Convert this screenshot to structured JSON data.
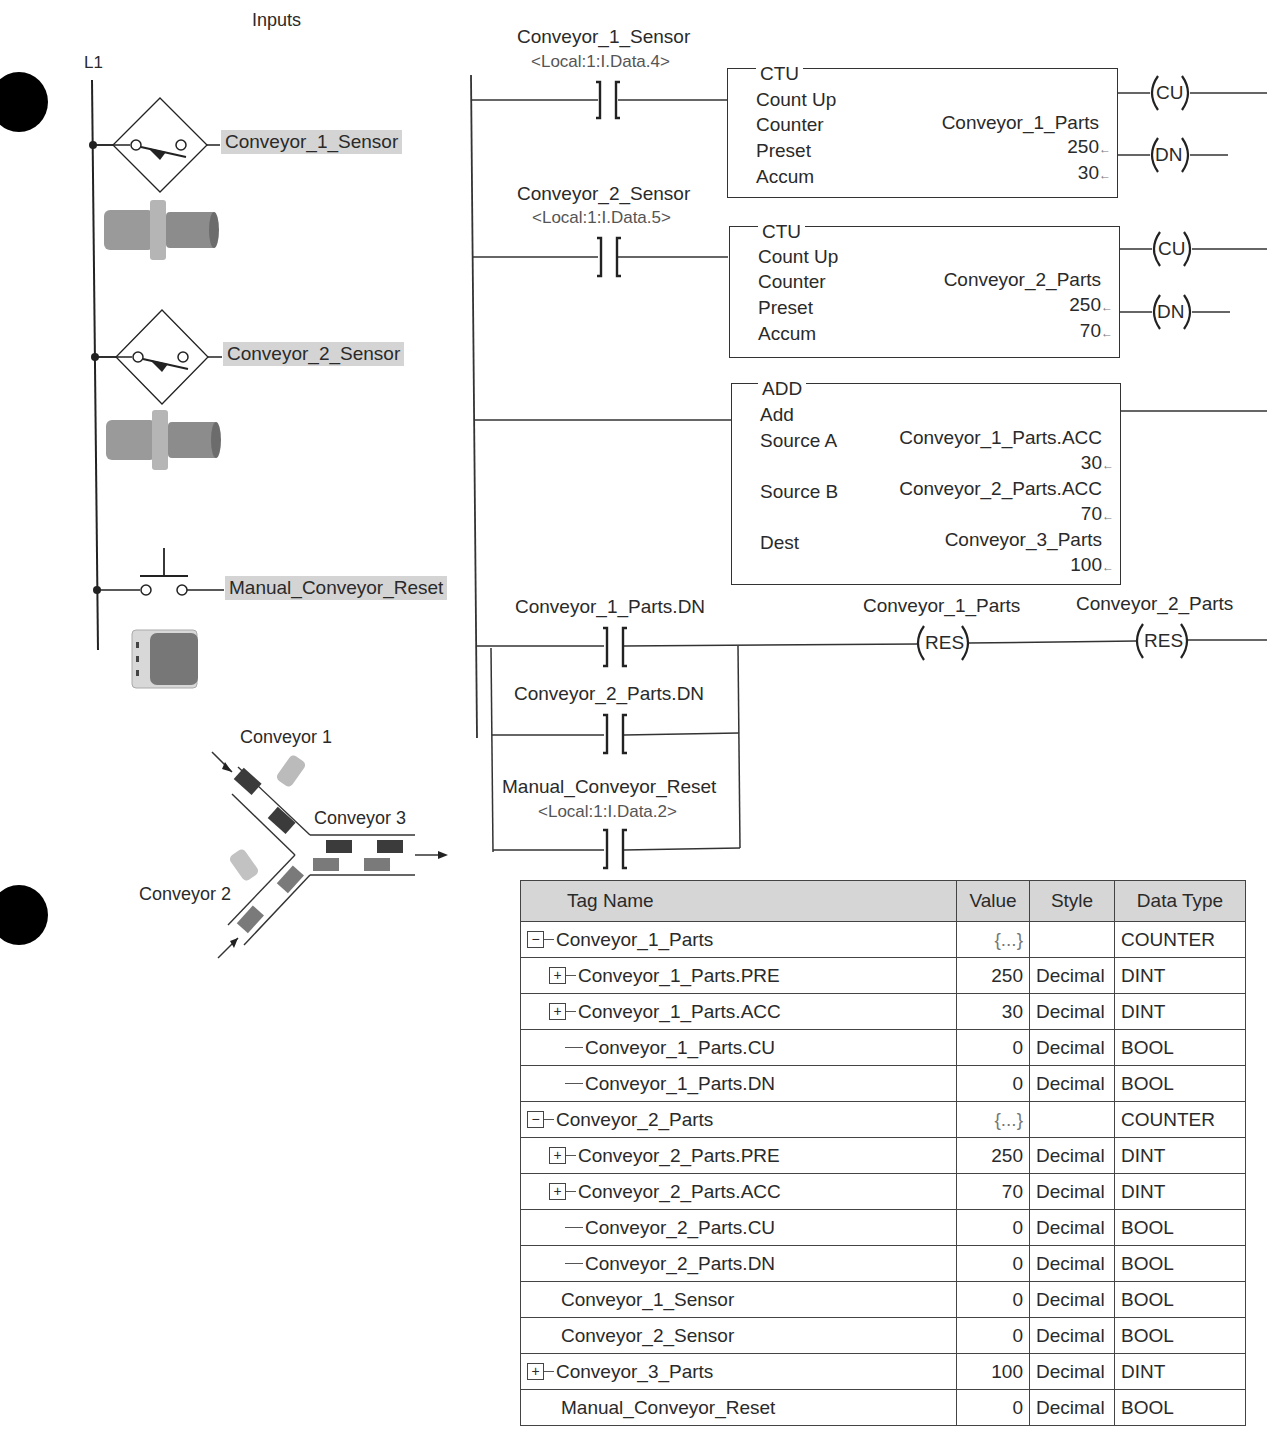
{
  "inputs_panel": {
    "title": "Inputs",
    "rail_label": "L1",
    "devices": [
      {
        "label": "Conveyor_1_Sensor",
        "symbol": "proximity-switch"
      },
      {
        "label": "Conveyor_2_Sensor",
        "symbol": "proximity-switch"
      },
      {
        "label": "Manual_Conveyor_Reset",
        "symbol": "pushbutton-no"
      }
    ]
  },
  "conveyor_diagram": {
    "conveyor1": "Conveyor 1",
    "conveyor2": "Conveyor 2",
    "conveyor3": "Conveyor 3"
  },
  "ladder": {
    "rung1": {
      "contact_tag": "Conveyor_1_Sensor",
      "contact_address": "<Local:1:I.Data.4>",
      "instruction": "CTU",
      "description": "Count Up",
      "rows": [
        {
          "label": "Counter",
          "value": "Conveyor_1_Parts"
        },
        {
          "label": "Preset",
          "value": "250"
        },
        {
          "label": "Accum",
          "value": "30"
        }
      ],
      "outputs": [
        "CU",
        "DN"
      ]
    },
    "rung2": {
      "contact_tag": "Conveyor_2_Sensor",
      "contact_address": "<Local:1:I.Data.5>",
      "instruction": "CTU",
      "description": "Count Up",
      "rows": [
        {
          "label": "Counter",
          "value": "Conveyor_2_Parts"
        },
        {
          "label": "Preset",
          "value": "250"
        },
        {
          "label": "Accum",
          "value": "70"
        }
      ],
      "outputs": [
        "CU",
        "DN"
      ]
    },
    "rung3": {
      "instruction": "ADD",
      "description": "Add",
      "source_a_label": "Source A",
      "source_a_tag": "Conveyor_1_Parts.ACC",
      "source_a_value": "30",
      "source_b_label": "Source B",
      "source_b_tag": "Conveyor_2_Parts.ACC",
      "source_b_value": "70",
      "dest_label": "Dest",
      "dest_tag": "Conveyor_3_Parts",
      "dest_value": "100"
    },
    "rung4": {
      "contacts": [
        {
          "tag": "Conveyor_1_Parts.DN",
          "address": ""
        },
        {
          "tag": "Conveyor_2_Parts.DN",
          "address": ""
        },
        {
          "tag": "Manual_Conveyor_Reset",
          "address": "<Local:1:I.Data.2>"
        }
      ],
      "coils": [
        {
          "tag": "Conveyor_1_Parts",
          "type": "RES"
        },
        {
          "tag": "Conveyor_2_Parts",
          "type": "RES"
        }
      ]
    },
    "arrow_glyph": "←"
  },
  "tag_table": {
    "columns": [
      "Tag Name",
      "Value",
      "Style",
      "Data Type"
    ],
    "rows": [
      {
        "name": "Conveyor_1_Parts",
        "value": "{...}",
        "style": "",
        "type": "COUNTER",
        "expander": "−",
        "level": 0
      },
      {
        "name": "Conveyor_1_Parts.PRE",
        "value": "250",
        "style": "Decimal",
        "type": "DINT",
        "expander": "+",
        "level": 1
      },
      {
        "name": "Conveyor_1_Parts.ACC",
        "value": "30",
        "style": "Decimal",
        "type": "DINT",
        "expander": "+",
        "level": 1
      },
      {
        "name": "Conveyor_1_Parts.CU",
        "value": "0",
        "style": "Decimal",
        "type": "BOOL",
        "expander": "",
        "level": 1
      },
      {
        "name": "Conveyor_1_Parts.DN",
        "value": "0",
        "style": "Decimal",
        "type": "BOOL",
        "expander": "",
        "level": 1
      },
      {
        "name": "Conveyor_2_Parts",
        "value": "{...}",
        "style": "",
        "type": "COUNTER",
        "expander": "−",
        "level": 0
      },
      {
        "name": "Conveyor_2_Parts.PRE",
        "value": "250",
        "style": "Decimal",
        "type": "DINT",
        "expander": "+",
        "level": 1
      },
      {
        "name": "Conveyor_2_Parts.ACC",
        "value": "70",
        "style": "Decimal",
        "type": "DINT",
        "expander": "+",
        "level": 1
      },
      {
        "name": "Conveyor_2_Parts.CU",
        "value": "0",
        "style": "Decimal",
        "type": "BOOL",
        "expander": "",
        "level": 1
      },
      {
        "name": "Conveyor_2_Parts.DN",
        "value": "0",
        "style": "Decimal",
        "type": "BOOL",
        "expander": "",
        "level": 1
      },
      {
        "name": "Conveyor_1_Sensor",
        "value": "0",
        "style": "Decimal",
        "type": "BOOL",
        "expander": "",
        "level": 0
      },
      {
        "name": "Conveyor_2_Sensor",
        "value": "0",
        "style": "Decimal",
        "type": "BOOL",
        "expander": "",
        "level": 0
      },
      {
        "name": "Conveyor_3_Parts",
        "value": "100",
        "style": "Decimal",
        "type": "DINT",
        "expander": "+",
        "level": 0
      },
      {
        "name": "Manual_Conveyor_Reset",
        "value": "0",
        "style": "Decimal",
        "type": "BOOL",
        "expander": "",
        "level": 0
      }
    ]
  }
}
